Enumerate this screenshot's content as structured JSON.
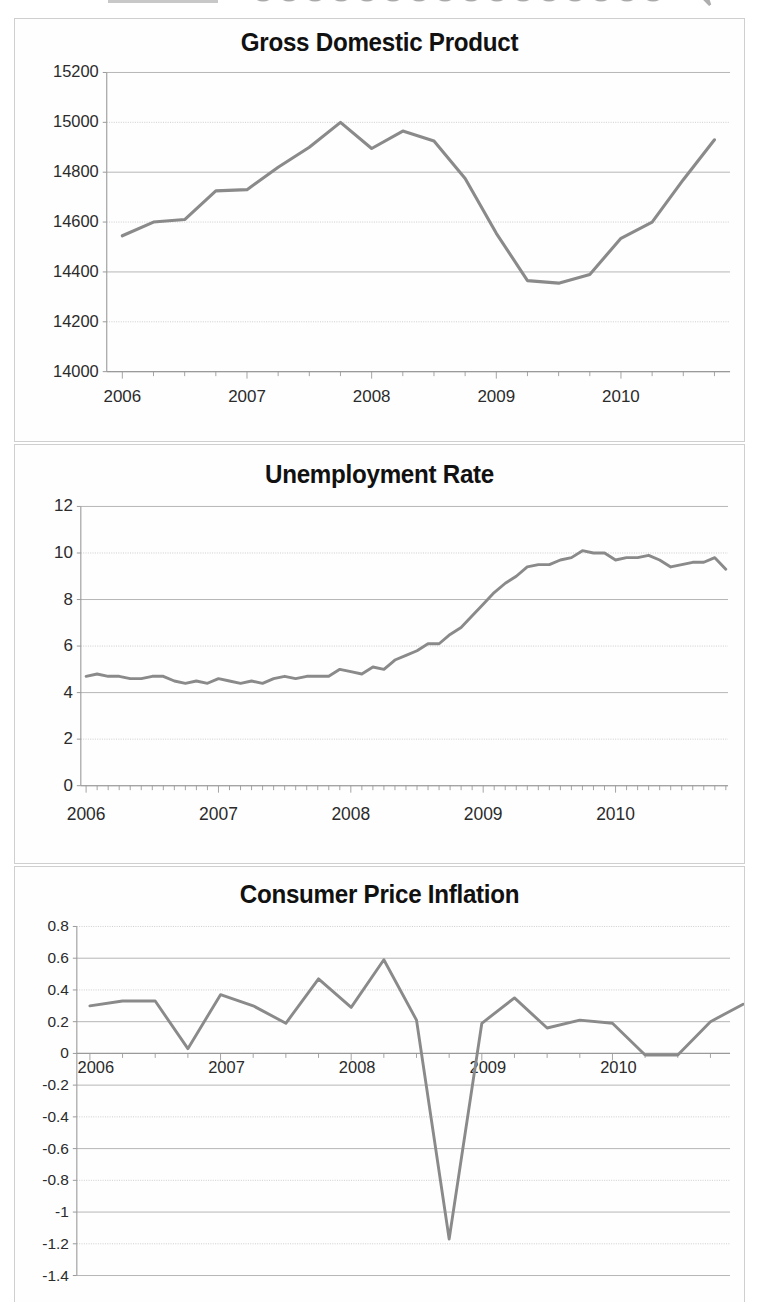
{
  "figure": {
    "name": "economic-indicators-three-panel-figure",
    "panel_count": 3,
    "line_color": "#8a8a8a",
    "grid_color": "#c8c8c8",
    "axis_color": "#9a9a9a",
    "text_color": "#1a1a1a",
    "background": "#ffffff"
  },
  "panels": [
    {
      "id": "gdp",
      "title": "Gross Domestic Product"
    },
    {
      "id": "unemployment",
      "title": "Unemployment Rate"
    },
    {
      "id": "cpi",
      "title": "Consumer Price Inflation"
    }
  ],
  "chart_data": [
    {
      "type": "line",
      "title": "Gross Domestic Product",
      "xlabel": "",
      "ylabel": "",
      "ylim": [
        14000,
        15200
      ],
      "yticks": [
        14000,
        14200,
        14400,
        14600,
        14800,
        15000,
        15200
      ],
      "ytick_labels": [
        "14000",
        "14200",
        "14400",
        "14600",
        "14800",
        "15000",
        "15200"
      ],
      "xlim": [
        2005.875,
        2010.875
      ],
      "xticks": [
        2006,
        2007,
        2008,
        2009,
        2010
      ],
      "xtick_labels": [
        "2006",
        "2007",
        "2008",
        "2009",
        "2010"
      ],
      "minor_xticks": "quarterly",
      "grid": true,
      "legend": false,
      "x": [
        2006.0,
        2006.25,
        2006.5,
        2006.75,
        2007.0,
        2007.25,
        2007.5,
        2007.75,
        2008.0,
        2008.25,
        2008.5,
        2008.75,
        2009.0,
        2009.25,
        2009.5,
        2009.75,
        2010.0,
        2010.25,
        2010.5,
        2010.75
      ],
      "values": [
        14545,
        14600,
        14610,
        14725,
        14730,
        14820,
        14900,
        15000,
        14895,
        14965,
        14925,
        14775,
        14555,
        14365,
        14355,
        14390,
        14535,
        14600,
        14770,
        14930
      ]
    },
    {
      "type": "line",
      "title": "Unemployment Rate",
      "xlabel": "",
      "ylabel": "",
      "ylim": [
        0,
        12
      ],
      "yticks": [
        0,
        2,
        4,
        6,
        8,
        10,
        12
      ],
      "ytick_labels": [
        "0",
        "2",
        "4",
        "6",
        "8",
        "10",
        "12"
      ],
      "xlim": [
        2005.96,
        2010.85
      ],
      "xticks": [
        2006,
        2007,
        2008,
        2009,
        2010
      ],
      "xtick_labels": [
        "2006",
        "2007",
        "2008",
        "2009",
        "2010"
      ],
      "minor_xticks": "monthly",
      "grid": true,
      "legend": false,
      "x": [
        2006.0,
        2006.083,
        2006.167,
        2006.25,
        2006.333,
        2006.417,
        2006.5,
        2006.583,
        2006.667,
        2006.75,
        2006.833,
        2006.917,
        2007.0,
        2007.083,
        2007.167,
        2007.25,
        2007.333,
        2007.417,
        2007.5,
        2007.583,
        2007.667,
        2007.75,
        2007.833,
        2007.917,
        2008.0,
        2008.083,
        2008.167,
        2008.25,
        2008.333,
        2008.417,
        2008.5,
        2008.583,
        2008.667,
        2008.75,
        2008.833,
        2008.917,
        2009.0,
        2009.083,
        2009.167,
        2009.25,
        2009.333,
        2009.417,
        2009.5,
        2009.583,
        2009.667,
        2009.75,
        2009.833,
        2009.917,
        2010.0,
        2010.083,
        2010.167,
        2010.25,
        2010.333,
        2010.417,
        2010.5,
        2010.583,
        2010.667,
        2010.75,
        2010.833
      ],
      "values": [
        4.7,
        4.8,
        4.7,
        4.7,
        4.6,
        4.6,
        4.7,
        4.7,
        4.5,
        4.4,
        4.5,
        4.4,
        4.6,
        4.5,
        4.4,
        4.5,
        4.4,
        4.6,
        4.7,
        4.6,
        4.7,
        4.7,
        4.7,
        5.0,
        4.9,
        4.8,
        5.1,
        5.0,
        5.4,
        5.6,
        5.8,
        6.1,
        6.1,
        6.5,
        6.8,
        7.3,
        7.8,
        8.3,
        8.7,
        9.0,
        9.4,
        9.5,
        9.5,
        9.7,
        9.8,
        10.1,
        10.0,
        10.0,
        9.7,
        9.8,
        9.8,
        9.9,
        9.7,
        9.4,
        9.5,
        9.6,
        9.6,
        9.8,
        9.3
      ]
    },
    {
      "type": "line",
      "title": "Consumer Price Inflation",
      "xlabel": "",
      "ylabel": "",
      "ylim": [
        -1.4,
        0.8
      ],
      "yticks": [
        -1.4,
        -1.2,
        -1.0,
        -0.8,
        -0.6,
        -0.4,
        -0.2,
        0,
        0.2,
        0.4,
        0.6,
        0.8
      ],
      "ytick_labels": [
        "-1.4",
        "-1.2",
        "-1",
        "-0.8",
        "-0.6",
        "-0.4",
        "-0.2",
        "0",
        "0.2",
        "0.4",
        "0.6",
        "0.8"
      ],
      "xlim": [
        2005.9,
        2010.9
      ],
      "xticks": [
        2006,
        2007,
        2008,
        2009,
        2010
      ],
      "xtick_labels": [
        "2006",
        "2007",
        "2008",
        "2009",
        "2010"
      ],
      "minor_xticks": "quarterly",
      "grid": true,
      "legend": false,
      "zero_line": true,
      "x": [
        2006.0,
        2006.25,
        2006.5,
        2006.75,
        2007.0,
        2007.25,
        2007.5,
        2007.75,
        2008.0,
        2008.25,
        2008.5,
        2008.75,
        2009.0,
        2009.25,
        2009.5,
        2009.75,
        2010.0,
        2010.25,
        2010.5,
        2010.75,
        2011.0
      ],
      "values": [
        0.3,
        0.33,
        0.33,
        0.03,
        0.37,
        0.3,
        0.19,
        0.47,
        0.29,
        0.59,
        0.21,
        -1.17,
        0.19,
        0.35,
        0.16,
        0.21,
        0.19,
        -0.01,
        -0.01,
        0.2,
        0.31
      ]
    }
  ]
}
